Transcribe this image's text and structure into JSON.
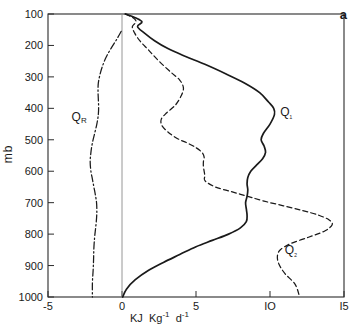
{
  "figure": {
    "panel_label": "a",
    "y_axis_label": "mb",
    "x_axis_label_parts": {
      "kj": "KJ",
      "kg": "Kg",
      "kg_exp": "-1",
      "d": "d",
      "d_exp": "-1"
    }
  },
  "chart_data": {
    "type": "line",
    "title": "",
    "subtitle": "",
    "xlabel": "KJ Kg-1 d-1",
    "ylabel": "mb",
    "xlim": [
      -5,
      15
    ],
    "ylim": [
      1000,
      100
    ],
    "y_inverted": true,
    "grid": false,
    "legend_position": "inline-annotations",
    "xticks": [
      -5,
      0,
      5,
      10,
      15
    ],
    "xticklabels": [
      "-5",
      "0",
      "5",
      "IO",
      "I5"
    ],
    "yticks": [
      100,
      200,
      300,
      400,
      500,
      600,
      700,
      800,
      900,
      1000
    ],
    "yticklabels": [
      "100",
      "200",
      "300",
      "400",
      "500",
      "600",
      "700",
      "800",
      "900",
      "1000"
    ],
    "zero_reference_line": 0,
    "annotations": [
      {
        "text": "Q_R",
        "label": "QR",
        "x": -2.8,
        "y": 430
      },
      {
        "text": "Q_1",
        "label": "Q1",
        "x": 11.3,
        "y": 415
      },
      {
        "text": "Q_2",
        "label": "Q2",
        "x": 11.6,
        "y": 855
      },
      {
        "text": "a",
        "label": "panel",
        "x": 14.2,
        "y": 125
      }
    ],
    "series": [
      {
        "name": "Q1",
        "label": "Q₁",
        "style": "solid",
        "color": "#1a1a1a",
        "x": [
          0.25,
          0.9,
          1.35,
          1.05,
          1.5,
          2.2,
          3.1,
          4.3,
          5.6,
          7.0,
          8.3,
          9.3,
          9.9,
          10.25,
          10.3,
          10.0,
          9.55,
          9.4,
          9.6,
          9.7,
          9.5,
          9.1,
          8.7,
          8.5,
          8.45,
          8.5,
          8.45,
          8.35,
          8.4,
          8.45,
          8.4,
          8.0,
          7.2,
          6.1,
          5.0,
          3.9,
          2.8,
          1.8,
          0.9,
          0.3,
          0.05
        ],
        "y": [
          100,
          112,
          125,
          140,
          160,
          185,
          210,
          235,
          260,
          290,
          320,
          350,
          380,
          400,
          420,
          450,
          480,
          500,
          520,
          540,
          560,
          580,
          600,
          620,
          640,
          660,
          680,
          700,
          720,
          740,
          760,
          780,
          800,
          820,
          840,
          865,
          890,
          915,
          945,
          975,
          1000
        ]
      },
      {
        "name": "Q2",
        "label": "Q₂",
        "style": "dashed",
        "color": "#1a1a1a",
        "x": [
          0.2,
          0.75,
          0.95,
          0.7,
          0.85,
          1.2,
          1.8,
          2.5,
          3.3,
          3.9,
          4.15,
          4.0,
          3.6,
          3.0,
          2.65,
          2.7,
          3.1,
          3.7,
          4.4,
          5.0,
          5.4,
          5.55,
          5.5,
          5.5,
          5.55,
          5.6,
          5.6,
          6.3,
          7.4,
          8.5,
          9.6,
          10.9,
          12.2,
          13.3,
          14.0,
          14.2,
          13.7,
          12.6,
          11.4,
          10.7,
          10.5,
          10.6,
          11.0,
          11.7,
          12.0
        ],
        "y": [
          100,
          112,
          125,
          140,
          160,
          185,
          215,
          250,
          285,
          310,
          335,
          360,
          390,
          415,
          435,
          455,
          475,
          495,
          510,
          525,
          540,
          555,
          570,
          585,
          600,
          615,
          630,
          650,
          665,
          680,
          695,
          710,
          725,
          740,
          755,
          770,
          790,
          810,
          830,
          850,
          870,
          895,
          925,
          960,
          1000
        ]
      },
      {
        "name": "QR",
        "label": "Qᴿ",
        "style": "dashdot",
        "color": "#1a1a1a",
        "x": [
          -0.05,
          -0.35,
          -0.75,
          -1.1,
          -1.35,
          -1.5,
          -1.6,
          -1.62,
          -1.6,
          -1.58,
          -1.6,
          -1.7,
          -1.85,
          -2.0,
          -2.1,
          -2.15,
          -2.1,
          -2.0,
          -1.9,
          -1.8,
          -1.72,
          -1.7,
          -1.72,
          -1.78,
          -1.85,
          -1.9,
          -1.92,
          -1.95,
          -2.0,
          -2.0
        ],
        "y": [
          155,
          180,
          210,
          240,
          270,
          295,
          320,
          345,
          370,
          395,
          420,
          450,
          480,
          510,
          540,
          570,
          600,
          625,
          650,
          675,
          700,
          725,
          750,
          780,
          810,
          845,
          880,
          915,
          955,
          1000
        ]
      }
    ]
  }
}
